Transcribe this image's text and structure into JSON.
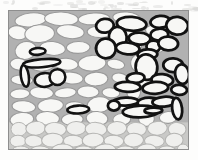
{
  "figure": {
    "kind": "scientific-illustration",
    "frame": {
      "x": 8,
      "y": 10,
      "width": 181,
      "height": 140,
      "border_color": "#8e8e8e"
    },
    "colors": {
      "matrix_gray": "#b1b1b1",
      "grain_white": "#f7f7f5",
      "grain_outline_light": "#9a9a9a",
      "highlight_outline_black": "#121212",
      "basal_layer_gray": "#c9c9c7",
      "page_white": "#fdfdfc"
    },
    "regions": [
      {
        "name": "upper-left-matrix",
        "note": "white ellipses, light outlines, on gray matrix"
      },
      {
        "name": "right-cluster",
        "note": "ellipses with thick black outlines, densely clustered"
      },
      {
        "name": "basal-packed-layer",
        "note": "dense pale packed grain layer at base"
      }
    ]
  },
  "chart_data": {
    "type": "scatter",
    "title": "",
    "xlabel": "",
    "ylabel": "",
    "xlim": [
      0,
      181
    ],
    "ylim": [
      0,
      140
    ],
    "grid": false,
    "legend": "none",
    "note": "Each datum is an ellipse: cx, cy, rx, ry, rotation (deg), stroke class",
    "series": [
      {
        "name": "matrix-grains-light",
        "stroke": "#9a9a9a",
        "fill": "#f7f7f5",
        "stroke_width": 1.1,
        "ellipses": [
          [
            22,
            9,
            16,
            7,
            -6
          ],
          [
            53,
            8,
            17,
            7,
            2
          ],
          [
            86,
            8,
            16,
            6,
            -3
          ],
          [
            119,
            7,
            14,
            6,
            4
          ],
          [
            9,
            22,
            10,
            7,
            10
          ],
          [
            31,
            23,
            15,
            9,
            -4
          ],
          [
            62,
            21,
            14,
            7,
            6
          ],
          [
            92,
            21,
            13,
            6,
            0
          ],
          [
            122,
            20,
            13,
            6,
            -5
          ],
          [
            150,
            20,
            12,
            6,
            3
          ],
          [
            17,
            40,
            11,
            9,
            -14
          ],
          [
            44,
            38,
            13,
            7,
            5
          ],
          [
            70,
            37,
            12,
            6,
            -2
          ],
          [
            99,
            38,
            12,
            7,
            8
          ],
          [
            126,
            36,
            8,
            10,
            0
          ],
          [
            148,
            37,
            10,
            6,
            -8
          ],
          [
            10,
            54,
            9,
            6,
            6
          ],
          [
            34,
            55,
            12,
            6,
            -5
          ],
          [
            58,
            54,
            12,
            6,
            4
          ],
          [
            84,
            53,
            14,
            8,
            -3
          ],
          [
            108,
            54,
            9,
            5,
            10
          ],
          [
            131,
            53,
            8,
            9,
            -6
          ],
          [
            13,
            70,
            11,
            5,
            3
          ],
          [
            38,
            69,
            13,
            6,
            -4
          ],
          [
            63,
            68,
            12,
            6,
            5
          ],
          [
            88,
            69,
            12,
            7,
            -2
          ],
          [
            112,
            68,
            8,
            5,
            8
          ],
          [
            136,
            69,
            7,
            9,
            -10
          ],
          [
            11,
            84,
            10,
            5,
            -3
          ],
          [
            33,
            83,
            12,
            6,
            4
          ],
          [
            57,
            83,
            11,
            5,
            -6
          ],
          [
            80,
            82,
            11,
            6,
            2
          ],
          [
            103,
            83,
            9,
            5,
            6
          ],
          [
            126,
            82,
            7,
            8,
            -4
          ],
          [
            15,
            97,
            12,
            6,
            5
          ],
          [
            42,
            96,
            13,
            7,
            -3
          ],
          [
            67,
            97,
            10,
            5,
            4
          ],
          [
            91,
            95,
            12,
            8,
            -6
          ],
          [
            117,
            96,
            8,
            5,
            2
          ],
          [
            141,
            96,
            7,
            9,
            -8
          ],
          [
            13,
            110,
            12,
            7,
            -5
          ],
          [
            39,
            109,
            12,
            7,
            3
          ],
          [
            64,
            110,
            11,
            6,
            -2
          ],
          [
            89,
            109,
            11,
            7,
            5
          ],
          [
            114,
            110,
            9,
            6,
            -3
          ],
          [
            139,
            109,
            8,
            8,
            6
          ],
          [
            161,
            108,
            9,
            6,
            -4
          ]
        ]
      },
      {
        "name": "basal-packed-layer",
        "stroke": "#b4b4b2",
        "fill": "#efefed",
        "stroke_width": 1.0,
        "ellipses": [
          [
            10,
            120,
            8,
            7,
            0
          ],
          [
            27,
            119,
            10,
            7,
            -4
          ],
          [
            47,
            120,
            11,
            7,
            3
          ],
          [
            68,
            119,
            10,
            7,
            -2
          ],
          [
            88,
            120,
            11,
            7,
            4
          ],
          [
            109,
            119,
            10,
            7,
            -3
          ],
          [
            129,
            120,
            10,
            7,
            2
          ],
          [
            150,
            119,
            10,
            7,
            -4
          ],
          [
            170,
            120,
            9,
            7,
            3
          ],
          [
            9,
            132,
            8,
            6,
            0
          ],
          [
            25,
            132,
            9,
            6,
            4
          ],
          [
            44,
            131,
            11,
            7,
            -3
          ],
          [
            65,
            132,
            10,
            6,
            2
          ],
          [
            85,
            131,
            11,
            7,
            -4
          ],
          [
            106,
            132,
            10,
            6,
            3
          ],
          [
            126,
            131,
            10,
            7,
            -2
          ],
          [
            147,
            132,
            10,
            6,
            4
          ],
          [
            167,
            131,
            9,
            7,
            -3
          ],
          [
            12,
            142,
            9,
            5,
            0
          ],
          [
            32,
            142,
            10,
            5,
            3
          ],
          [
            54,
            141,
            11,
            6,
            -2
          ],
          [
            76,
            142,
            10,
            5,
            4
          ],
          [
            97,
            141,
            11,
            6,
            -3
          ],
          [
            118,
            142,
            10,
            5,
            2
          ],
          [
            139,
            141,
            10,
            6,
            -4
          ],
          [
            160,
            142,
            9,
            5,
            3
          ],
          [
            176,
            141,
            6,
            6,
            0
          ]
        ]
      },
      {
        "name": "highlighted-grains-left",
        "stroke": "#121212",
        "fill": "#f7f7f5",
        "stroke_width": 2.6,
        "ellipses": [
          [
            29,
            41,
            8,
            3.5,
            -4
          ],
          [
            33,
            53,
            19,
            4,
            -5
          ],
          [
            16,
            66,
            4,
            11,
            -8
          ],
          [
            36,
            70,
            10,
            7,
            -3
          ],
          [
            49,
            67,
            8,
            8,
            0
          ],
          [
            70,
            100,
            11,
            4,
            -3
          ]
        ]
      },
      {
        "name": "highlighted-grains-right",
        "stroke": "#121212",
        "fill": "#f7f7f5",
        "stroke_width": 2.8,
        "ellipses": [
          [
            97,
            15,
            9,
            7,
            -8
          ],
          [
            124,
            13,
            15,
            7,
            4
          ],
          [
            153,
            11,
            10,
            6,
            -5
          ],
          [
            170,
            15,
            11,
            9,
            6
          ],
          [
            110,
            27,
            9,
            11,
            -6
          ],
          [
            132,
            28,
            11,
            6,
            3
          ],
          [
            152,
            24,
            9,
            6,
            -4
          ],
          [
            146,
            36,
            7,
            6,
            0
          ],
          [
            98,
            38,
            10,
            10,
            -7
          ],
          [
            120,
            38,
            12,
            6,
            5
          ],
          [
            140,
            44,
            10,
            5,
            -3
          ],
          [
            161,
            33,
            10,
            7,
            4
          ],
          [
            139,
            57,
            11,
            13,
            -5
          ],
          [
            166,
            55,
            10,
            7,
            3
          ],
          [
            128,
            68,
            9,
            5,
            -4
          ],
          [
            155,
            70,
            11,
            6,
            5
          ],
          [
            175,
            64,
            7,
            10,
            -6
          ],
          [
            120,
            77,
            13,
            5,
            2
          ],
          [
            148,
            78,
            13,
            6,
            -3
          ],
          [
            172,
            80,
            8,
            5,
            4
          ],
          [
            118,
            92,
            13,
            4,
            -2
          ],
          [
            106,
            96,
            6,
            5,
            0
          ],
          [
            143,
            94,
            13,
            6,
            3
          ],
          [
            157,
            92,
            12,
            5,
            -4
          ],
          [
            133,
            102,
            18,
            6,
            -2
          ],
          [
            146,
            101,
            9,
            3,
            -2
          ],
          [
            170,
            99,
            5,
            11,
            -7
          ]
        ]
      }
    ]
  }
}
